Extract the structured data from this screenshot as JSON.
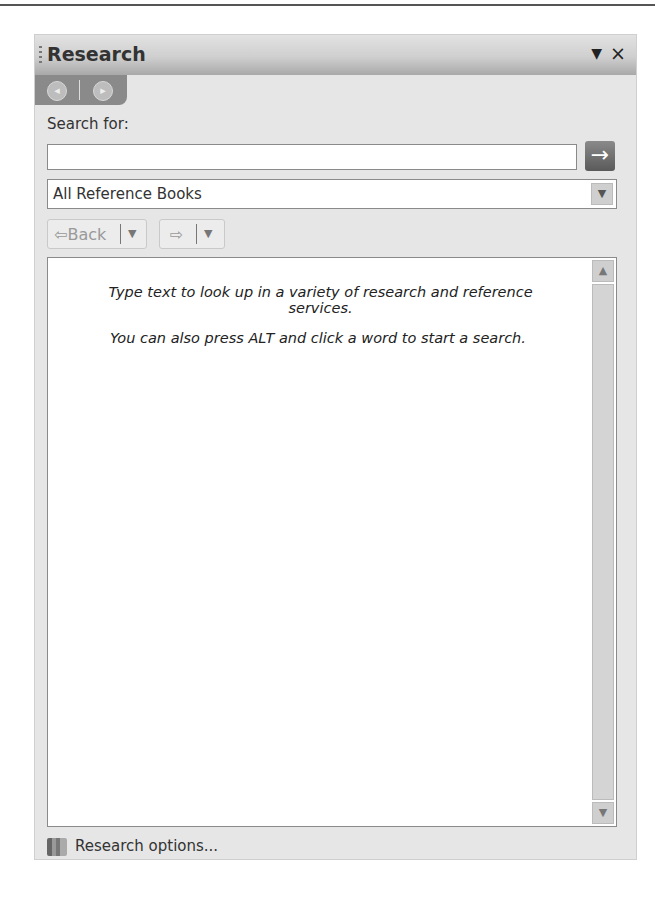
{
  "panel": {
    "title": "Research",
    "menu_icon": "▼",
    "close_icon": "×"
  },
  "nav_tab": {
    "back_icon": "◂",
    "forward_icon": "▸"
  },
  "search": {
    "label": "Search for:",
    "value": "",
    "placeholder": "",
    "go_icon": "→"
  },
  "source": {
    "selected": "All Reference Books",
    "dropdown_icon": "▼"
  },
  "history": {
    "back_label": "⇦Back",
    "forward_label": "⇨",
    "menu_icon": "▼"
  },
  "content": {
    "message_1": "Type text to look up in a variety of research and reference services.",
    "message_2": "You can also press ALT and click a word to start a search.",
    "scroll_up": "▲",
    "scroll_down": "▼"
  },
  "footer": {
    "options_label": "Research options..."
  }
}
